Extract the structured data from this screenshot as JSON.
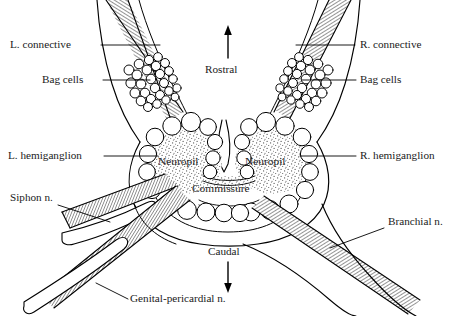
{
  "figure": {
    "name": "aplysia-abdominal-ganglion-diagram",
    "type": "anatomical-line-drawing",
    "background_color": "#ffffff",
    "ink_color": "#000000",
    "neuropil_fill": "stippled-gray",
    "nerve_fill": "fine-diagonal-hatching"
  },
  "labels": {
    "left_connective": "L. connective",
    "left_bag_cells": "Bag cells",
    "left_hemiganglion": "L. hemiganglion",
    "siphon_nerve": "Siphon n.",
    "right_connective": "R. connective",
    "right_bag_cells": "Bag cells",
    "right_hemiganglion": "R. hemiganglion",
    "branchial_nerve": "Branchial n.",
    "genital_pericardial_nerve": "Genital-pericardial n.",
    "neuropil_left": "Neuropil",
    "neuropil_right": "Neuropil",
    "commissure": "Commissure"
  },
  "orientation": {
    "rostral": "Rostral",
    "caudal": "Caudal"
  }
}
